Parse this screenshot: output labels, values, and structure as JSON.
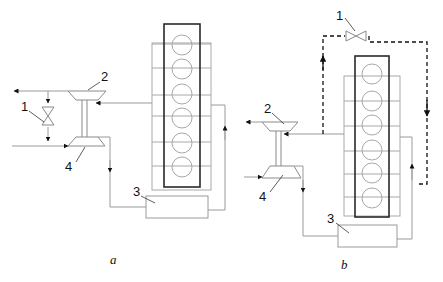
{
  "figure": {
    "panels": [
      {
        "id": "a",
        "caption": "a",
        "labels": {
          "valve": "1",
          "turbine": "2",
          "cooler": "3",
          "compressor": "4"
        },
        "engine": {
          "cylinders": 6
        }
      },
      {
        "id": "b",
        "caption": "b",
        "labels": {
          "valve": "1",
          "turbine": "2",
          "cooler": "3",
          "compressor": "4"
        },
        "engine": {
          "cylinders": 6
        },
        "bypass_line": "dashed"
      }
    ],
    "colors": {
      "line": "#9a9a9a",
      "heavy": "#2a2a2a",
      "arrow": "#111111"
    }
  }
}
